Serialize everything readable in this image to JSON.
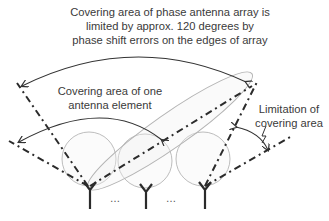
{
  "labels": {
    "array_coverage": [
      "Covering area of phase antenna array is",
      "limited by approx. 120 degrees by",
      "phase shift errors on the edges of array"
    ],
    "element_coverage": [
      "Covering area of one",
      "antenna element"
    ],
    "limitation": [
      "Limitation of",
      "covering area"
    ]
  },
  "ellipsis": "…",
  "diagram": {
    "antenna_count_shown": 3,
    "array_coverage_angle_deg": 120,
    "colors": {
      "lines": "#2b2b2b",
      "circles": "#b8b8b8",
      "ellipse": "#b0b0b0",
      "text": "#3a3a3a"
    }
  }
}
